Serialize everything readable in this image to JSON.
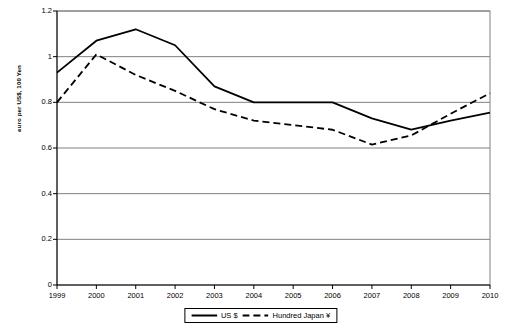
{
  "chart_data": {
    "type": "line",
    "title": "",
    "xlabel": "",
    "ylabel": "euro per US$, 100 Yen",
    "categories": [
      "1999",
      "2000",
      "2001",
      "2002",
      "2003",
      "2004",
      "2005",
      "2006",
      "2007",
      "2008",
      "2009",
      "2010"
    ],
    "ylim": [
      0,
      1.2
    ],
    "ytick_values": [
      0,
      0.2,
      0.4,
      0.6,
      0.8,
      1,
      1.2
    ],
    "ytick_labels": [
      "0",
      "0.2",
      "0.4",
      "0.6",
      "0.8",
      "1",
      "1.2"
    ],
    "grid": "horizontal",
    "legend_position": "bottom-center",
    "series": [
      {
        "name": "US $",
        "style": "solid",
        "color": "#000000",
        "values": [
          0.93,
          1.07,
          1.12,
          1.05,
          0.87,
          0.8,
          0.8,
          0.8,
          0.73,
          0.68,
          0.72,
          0.755
        ]
      },
      {
        "name": "Hundred Japan ¥",
        "style": "dashed",
        "color": "#000000",
        "values": [
          0.8,
          1.01,
          0.92,
          0.85,
          0.77,
          0.72,
          0.7,
          0.68,
          0.615,
          0.655,
          0.75,
          0.84
        ]
      }
    ]
  },
  "axis": {
    "y_label_text": "euro per US$, 100 Yen"
  },
  "legend": {
    "items": [
      {
        "label": "US $",
        "style": "solid"
      },
      {
        "label": "Hundred Japan ¥",
        "style": "dashed"
      }
    ]
  }
}
